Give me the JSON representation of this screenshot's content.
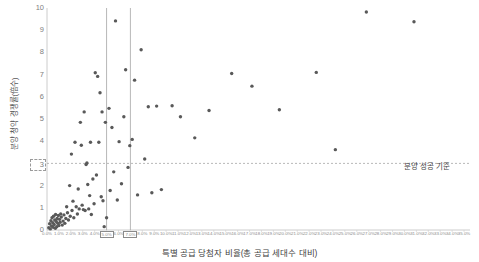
{
  "chart_data": {
    "type": "scatter",
    "title": "",
    "xlabel": "특별 공급 당첨자 비율(총 공급 세대수 대비)",
    "ylabel": "분양 청약 경쟁률(倍수)",
    "xlim": [
      0,
      35.5
    ],
    "ylim": [
      0,
      10
    ],
    "grid": false,
    "legend": "none",
    "x_ticks": [
      "0.0%",
      "1.0%",
      "2.0%",
      "3.0%",
      "4.0%",
      "5.0%",
      "6.0%",
      "7.0%",
      "8.0%",
      "9.0%",
      "10.0%",
      "11.0%",
      "12.0%",
      "13.0%",
      "14.0%",
      "15.0%",
      "16.0%",
      "17.0%",
      "18.0%",
      "19.0%",
      "20.0%",
      "21.0%",
      "22.0%",
      "23.0%",
      "24.0%",
      "25.0%",
      "26.0%",
      "27.0%",
      "28.0%",
      "29.0%",
      "30.0%",
      "31.0%",
      "32.0%",
      "33.0%",
      "34.0%",
      "35.0%"
    ],
    "y_ticks": [
      "0",
      "1",
      "2",
      "3",
      "4",
      "5",
      "6",
      "7",
      "8",
      "9",
      "10"
    ],
    "highlighted_y_tick": "3",
    "highlighted_x_ticks": [
      "5.0%",
      "7.0%"
    ],
    "reference_lines": [
      {
        "name": "분양 성공 기준",
        "orientation": "horizontal",
        "value": 3,
        "style": "dashed",
        "label": "분양 성공 기준"
      },
      {
        "name": "vertical-5pct",
        "orientation": "vertical",
        "value": 5.0,
        "style": "solid",
        "label": ""
      },
      {
        "name": "vertical-7pct",
        "orientation": "vertical",
        "value": 7.0,
        "style": "solid",
        "label": ""
      }
    ],
    "marker_color": "#595959",
    "series": [
      {
        "name": "단지",
        "points": [
          [
            0.15,
            0.1
          ],
          [
            0.22,
            0.28
          ],
          [
            0.28,
            0.05
          ],
          [
            0.33,
            0.42
          ],
          [
            0.38,
            0.18
          ],
          [
            0.42,
            0.55
          ],
          [
            0.48,
            0.33
          ],
          [
            0.52,
            0.12
          ],
          [
            0.55,
            0.62
          ],
          [
            0.6,
            0.25
          ],
          [
            0.65,
            0.45
          ],
          [
            0.7,
            0.08
          ],
          [
            0.72,
            0.7
          ],
          [
            0.78,
            0.38
          ],
          [
            0.82,
            0.15
          ],
          [
            0.85,
            0.52
          ],
          [
            0.9,
            0.3
          ],
          [
            0.95,
            0.65
          ],
          [
            1.0,
            0.2
          ],
          [
            1.05,
            0.48
          ],
          [
            1.1,
            0.35
          ],
          [
            1.15,
            0.72
          ],
          [
            1.2,
            0.58
          ],
          [
            1.28,
            0.22
          ],
          [
            1.35,
            0.4
          ],
          [
            1.42,
            0.68
          ],
          [
            1.5,
            0.3
          ],
          [
            1.58,
            0.52
          ],
          [
            1.65,
            1.05
          ],
          [
            1.72,
            0.78
          ],
          [
            1.8,
            0.45
          ],
          [
            1.9,
            2.0
          ],
          [
            1.95,
            0.62
          ],
          [
            2.05,
            3.42
          ],
          [
            2.1,
            0.88
          ],
          [
            2.18,
            1.3
          ],
          [
            2.25,
            0.55
          ],
          [
            2.35,
            3.95
          ],
          [
            2.45,
            1.05
          ],
          [
            2.55,
            0.72
          ],
          [
            2.62,
            1.85
          ],
          [
            2.7,
            0.95
          ],
          [
            2.8,
            4.85
          ],
          [
            2.88,
            3.82
          ],
          [
            2.95,
            1.12
          ],
          [
            3.05,
            0.92
          ],
          [
            3.12,
            5.32
          ],
          [
            3.2,
            0.88
          ],
          [
            3.28,
            2.95
          ],
          [
            3.35,
            3.02
          ],
          [
            3.42,
            2.05
          ],
          [
            3.5,
            0.95
          ],
          [
            3.58,
            1.55
          ],
          [
            3.65,
            3.95
          ],
          [
            3.72,
            0.7
          ],
          [
            3.85,
            2.3
          ],
          [
            3.95,
            1.18
          ],
          [
            4.05,
            7.08
          ],
          [
            4.15,
            2.48
          ],
          [
            4.25,
            6.92
          ],
          [
            4.35,
            3.95
          ],
          [
            4.45,
            6.18
          ],
          [
            4.55,
            1.5
          ],
          [
            4.62,
            5.32
          ],
          [
            4.7,
            1.32
          ],
          [
            4.8,
            0.15
          ],
          [
            4.9,
            4.85
          ],
          [
            5.0,
            0.55
          ],
          [
            5.2,
            5.48
          ],
          [
            5.3,
            1.78
          ],
          [
            5.45,
            4.62
          ],
          [
            5.6,
            2.62
          ],
          [
            5.75,
            9.42
          ],
          [
            5.9,
            1.35
          ],
          [
            6.05,
            3.98
          ],
          [
            6.25,
            2.08
          ],
          [
            6.45,
            5.1
          ],
          [
            6.6,
            7.22
          ],
          [
            6.8,
            2.82
          ],
          [
            6.95,
            3.8
          ],
          [
            7.15,
            4.08
          ],
          [
            7.35,
            6.75
          ],
          [
            7.6,
            1.58
          ],
          [
            7.9,
            8.12
          ],
          [
            8.2,
            3.2
          ],
          [
            8.5,
            5.55
          ],
          [
            8.8,
            1.68
          ],
          [
            9.2,
            5.58
          ],
          [
            9.6,
            1.82
          ],
          [
            10.5,
            5.6
          ],
          [
            11.2,
            5.1
          ],
          [
            12.4,
            4.15
          ],
          [
            13.6,
            5.38
          ],
          [
            15.5,
            7.05
          ],
          [
            17.2,
            6.48
          ],
          [
            19.5,
            5.42
          ],
          [
            22.6,
            7.1
          ],
          [
            26.8,
            9.82
          ],
          [
            30.8,
            9.38
          ],
          [
            24.2,
            3.62
          ]
        ]
      }
    ]
  }
}
